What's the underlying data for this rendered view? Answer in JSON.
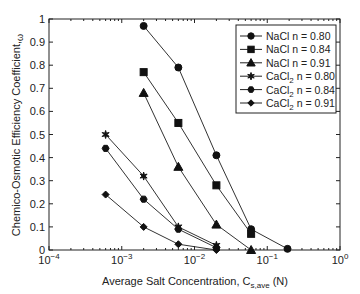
{
  "chart_data": {
    "type": "line",
    "title": "",
    "xlabel": "Average Salt Concentration, C_s,ave (N)",
    "ylabel": "Chemico-Osmotic Efficiency Coefficient, ω",
    "xscale": "log",
    "xlim": [
      0.0001,
      1
    ],
    "ylim": [
      0,
      1
    ],
    "x_ticks": [
      "10^-4",
      "10^-3",
      "10^-2",
      "10^-1",
      "10^0"
    ],
    "y_ticks": [
      "0",
      "0.1",
      "0.2",
      "0.3",
      "0.4",
      "0.5",
      "0.6",
      "0.7",
      "0.8",
      "0.9",
      "1"
    ],
    "grid": false,
    "legend_position": "upper right",
    "series": [
      {
        "name": "NaCl n = 0.80",
        "marker": "circle",
        "x": [
          0.002,
          0.006,
          0.02,
          0.06,
          0.19
        ],
        "values": [
          0.97,
          0.79,
          0.41,
          0.09,
          0.005
        ]
      },
      {
        "name": "NaCl n = 0.84",
        "marker": "square",
        "x": [
          0.002,
          0.006,
          0.02,
          0.06
        ],
        "values": [
          0.77,
          0.55,
          0.28,
          0.07
        ]
      },
      {
        "name": "NaCl n = 0.91",
        "marker": "triangle",
        "x": [
          0.002,
          0.006,
          0.02,
          0.06
        ],
        "values": [
          0.68,
          0.36,
          0.11,
          0.0
        ]
      },
      {
        "name": "CaCl2 n = 0.80",
        "marker": "star",
        "x": [
          0.0006,
          0.002,
          0.006,
          0.02
        ],
        "values": [
          0.5,
          0.32,
          0.1,
          0.02
        ]
      },
      {
        "name": "CaCl2 n = 0.84",
        "marker": "hexagon",
        "x": [
          0.0006,
          0.002,
          0.006,
          0.02
        ],
        "values": [
          0.44,
          0.22,
          0.09,
          0.01
        ]
      },
      {
        "name": "CaCl2 n = 0.91",
        "marker": "diamond",
        "x": [
          0.0006,
          0.002,
          0.006,
          0.02
        ],
        "values": [
          0.24,
          0.1,
          0.025,
          0.0
        ]
      }
    ]
  },
  "legend": {
    "items": [
      {
        "salt": "NaCl",
        "sub": "",
        "rest": " n = 0.80"
      },
      {
        "salt": "NaCl",
        "sub": "",
        "rest": " n = 0.84"
      },
      {
        "salt": "NaCl",
        "sub": "",
        "rest": " n = 0.91"
      },
      {
        "salt": "CaCl",
        "sub": "2",
        "rest": " n = 0.80"
      },
      {
        "salt": "CaCl",
        "sub": "2",
        "rest": " n = 0.84"
      },
      {
        "salt": "CaCl",
        "sub": "2",
        "rest": " n = 0.91"
      }
    ]
  },
  "axes": {
    "xlabel_main": "Average Salt Concentration, C",
    "xlabel_sub": "s,ave",
    "xlabel_unit": " (N)",
    "ylabel_main": "Chemico-Osmotic Efficiency Coefficient,",
    "ylabel_sym": "ω"
  }
}
